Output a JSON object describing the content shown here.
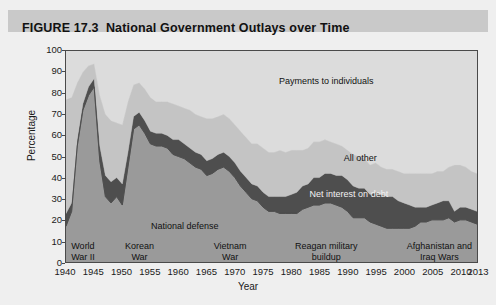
{
  "figure": {
    "number": "FIGURE 17.3",
    "title": "National Government Outlays over Time"
  },
  "chart_data": {
    "type": "area",
    "stacked": true,
    "title": "National Government Outlays over Time",
    "xlabel": "Year",
    "ylabel": "Percentage",
    "xlim": [
      1940,
      2013
    ],
    "ylim": [
      0,
      100
    ],
    "grid": false,
    "legend_position": "in-plot annotations",
    "xticks": [
      1940,
      1945,
      1950,
      1955,
      1960,
      1965,
      1970,
      1975,
      1980,
      1985,
      1990,
      1995,
      2000,
      2005,
      2010,
      2013
    ],
    "yticks": [
      0,
      10,
      20,
      30,
      40,
      50,
      60,
      70,
      80,
      90,
      100
    ],
    "x": [
      1940,
      1941,
      1942,
      1943,
      1944,
      1945,
      1946,
      1947,
      1948,
      1949,
      1950,
      1951,
      1952,
      1953,
      1954,
      1955,
      1956,
      1957,
      1958,
      1959,
      1960,
      1961,
      1962,
      1963,
      1964,
      1965,
      1966,
      1967,
      1968,
      1969,
      1970,
      1971,
      1972,
      1973,
      1974,
      1975,
      1976,
      1977,
      1978,
      1979,
      1980,
      1981,
      1982,
      1983,
      1984,
      1985,
      1986,
      1987,
      1988,
      1989,
      1990,
      1991,
      1992,
      1993,
      1994,
      1995,
      1996,
      1997,
      1998,
      1999,
      2000,
      2001,
      2002,
      2003,
      2004,
      2005,
      2006,
      2007,
      2008,
      2009,
      2010,
      2011,
      2012,
      2013
    ],
    "series": [
      {
        "name": "National defense",
        "color": "#9a9a9a",
        "values": [
          17,
          24,
          55,
          72,
          79,
          83,
          48,
          31,
          28,
          31,
          27,
          45,
          63,
          65,
          61,
          56,
          55,
          55,
          54,
          51,
          50,
          49,
          47,
          45,
          44,
          41,
          42,
          44,
          45,
          43,
          40,
          36,
          33,
          30,
          29,
          26,
          24,
          24,
          23,
          23,
          23,
          23,
          25,
          26,
          27,
          27,
          28,
          28,
          27,
          26,
          24,
          21,
          21,
          21,
          19,
          18,
          17,
          16,
          16,
          16,
          16,
          16,
          17,
          19,
          19,
          20,
          20,
          20,
          21,
          19,
          20,
          20,
          19,
          18
        ],
        "stack_order": 1
      },
      {
        "name": "Net interest on debt",
        "color": "#4e4e4e",
        "values": [
          6,
          4,
          3,
          3,
          4,
          4,
          7,
          10,
          10,
          9,
          10,
          7,
          6,
          6,
          6,
          6,
          6,
          6,
          6,
          7,
          8,
          7,
          7,
          7,
          7,
          7,
          7,
          7,
          7,
          7,
          7,
          7,
          7,
          7,
          7,
          7,
          7,
          7,
          8,
          8,
          9,
          10,
          11,
          11,
          13,
          13,
          14,
          14,
          14,
          15,
          15,
          15,
          14,
          14,
          13,
          15,
          15,
          15,
          15,
          13,
          12,
          11,
          9,
          7,
          7,
          7,
          8,
          9,
          8,
          5,
          6,
          6,
          6,
          6
        ],
        "stack_order": 2
      },
      {
        "name": "All other",
        "color": "#c4c4c4",
        "values": [
          54,
          50,
          27,
          15,
          10,
          7,
          24,
          29,
          29,
          26,
          28,
          24,
          15,
          14,
          15,
          16,
          15,
          15,
          16,
          17,
          16,
          17,
          18,
          18,
          18,
          20,
          19,
          18,
          18,
          18,
          18,
          19,
          19,
          19,
          20,
          21,
          21,
          21,
          22,
          21,
          21,
          20,
          17,
          17,
          17,
          17,
          16,
          15,
          15,
          14,
          14,
          15,
          15,
          14,
          14,
          14,
          13,
          13,
          13,
          14,
          14,
          15,
          16,
          16,
          16,
          15,
          15,
          14,
          16,
          22,
          20,
          19,
          18,
          18
        ],
        "stack_order": 3
      },
      {
        "name": "Payments to individuals",
        "color": "#dcdcdc",
        "values": [
          23,
          22,
          15,
          10,
          7,
          6,
          21,
          30,
          33,
          34,
          35,
          24,
          16,
          15,
          18,
          22,
          24,
          24,
          24,
          25,
          26,
          27,
          28,
          30,
          31,
          32,
          32,
          31,
          30,
          32,
          35,
          38,
          41,
          44,
          44,
          46,
          48,
          48,
          47,
          48,
          47,
          47,
          47,
          46,
          43,
          43,
          42,
          43,
          44,
          45,
          47,
          49,
          50,
          51,
          54,
          53,
          55,
          56,
          56,
          57,
          58,
          58,
          58,
          58,
          58,
          58,
          57,
          57,
          55,
          54,
          54,
          55,
          57,
          58
        ],
        "stack_order": 4
      }
    ],
    "annotations": [
      {
        "id": "payments-to-individuals",
        "text": "Payments to individuals",
        "x": 1986,
        "y": 86
      },
      {
        "id": "all-other",
        "text": "All other",
        "x": 1992,
        "y": 50
      },
      {
        "id": "net-interest-on-debt",
        "text": "Net interest on debt",
        "x": 1990,
        "y": 33
      },
      {
        "id": "national-defense",
        "text": "National defense",
        "x": 1961,
        "y": 18
      },
      {
        "id": "world-war-ii",
        "text": "World War II",
        "line1": "World",
        "line2": "War II",
        "x": 1943,
        "y": 6
      },
      {
        "id": "korean-war",
        "text": "Korean War",
        "line1": "Korean",
        "line2": "War",
        "x": 1953,
        "y": 6
      },
      {
        "id": "vietnam-war",
        "text": "Vietnam War",
        "line1": "Vietnam",
        "line2": "War",
        "x": 1969,
        "y": 6
      },
      {
        "id": "reagan-military-buildup",
        "text": "Reagan military buildup",
        "line1": "Reagan military",
        "line2": "buildup",
        "x": 1986,
        "y": 6
      },
      {
        "id": "afghanistan-and-iraq-wars",
        "text": "Afghanistan and Iraq Wars",
        "line1": "Afghanistan and",
        "line2": "Iraq Wars",
        "x": 2006,
        "y": 6
      }
    ]
  },
  "colors": {
    "page_background": "#efefef",
    "title_band": "#c9c9c9",
    "plot_background": "#b3b3b3",
    "axis": "#4a4a4a",
    "national_defense": "#9a9a9a",
    "net_interest": "#4e4e4e",
    "all_other": "#c4c4c4",
    "payments": "#dcdcdc"
  }
}
